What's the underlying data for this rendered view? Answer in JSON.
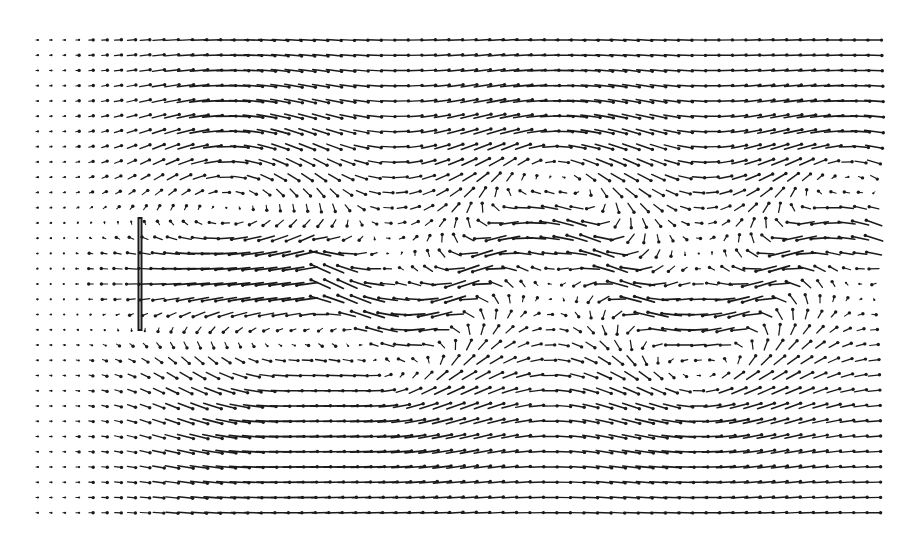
{
  "chart_data": {
    "type": "quiver",
    "title": "",
    "xlabel": "",
    "ylabel": "",
    "grid": false,
    "legend": null,
    "grid_layout": {
      "cols": 63,
      "rows": 32,
      "x0": 37,
      "y0": 40,
      "dx": 13.5,
      "dy": 15.25
    },
    "plate": {
      "x": 140,
      "y_top": 218,
      "y_bottom": 330,
      "width": 3
    },
    "flow_model": {
      "freestream_u": 1.0,
      "wake_center_y": 275,
      "wake_halfwidth": 55,
      "recirculation_u": -1.05,
      "wake_start_x": 140,
      "jet_end_x": 320,
      "wave_length": 300,
      "wave_amplitude": 55,
      "vortex_strength": 0.9,
      "vortices": [
        {
          "x": 230,
          "y": 185,
          "sign": 1
        },
        {
          "x": 250,
          "y": 365,
          "sign": -1
        },
        {
          "x": 560,
          "y": 195,
          "sign": 1
        },
        {
          "x": 400,
          "y": 355,
          "sign": -1
        },
        {
          "x": 850,
          "y": 210,
          "sign": 1
        },
        {
          "x": 700,
          "y": 350,
          "sign": -1
        }
      ],
      "vortex_radius": 75,
      "scale_px": 13,
      "edge_decay": 0.55
    },
    "style": {
      "vector_color": "#1a1a1a",
      "background": "#ffffff"
    }
  }
}
